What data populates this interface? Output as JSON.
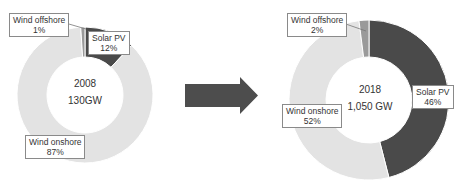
{
  "chart_data": [
    {
      "type": "pie",
      "subtype": "donut",
      "title": "2008",
      "total": "130GW",
      "categories": [
        "Solar PV",
        "Wind onshore",
        "Wind offshore"
      ],
      "values": [
        12,
        87,
        1
      ],
      "unit": "%",
      "colors": [
        "#4a4a4a",
        "#e3e3e3",
        "#9a9a9a"
      ]
    },
    {
      "type": "pie",
      "subtype": "donut",
      "title": "2018",
      "total": "1,050 GW",
      "categories": [
        "Solar PV",
        "Wind onshore",
        "Wind offshore"
      ],
      "values": [
        46,
        52,
        2
      ],
      "unit": "%",
      "colors": [
        "#4a4a4a",
        "#e3e3e3",
        "#9a9a9a"
      ]
    }
  ],
  "left": {
    "year": "2008",
    "total": "130GW",
    "labels": {
      "offshore": {
        "name": "Wind offshore",
        "pct": "1%"
      },
      "solar": {
        "name": "Solar PV",
        "pct": "12%"
      },
      "onshore": {
        "name": "Wind onshore",
        "pct": "87%"
      }
    }
  },
  "right": {
    "year": "2018",
    "total": "1,050 GW",
    "labels": {
      "offshore": {
        "name": "Wind offshore",
        "pct": "2%"
      },
      "solar": {
        "name": "Solar PV",
        "pct": "46%"
      },
      "onshore": {
        "name": "Wind onshore",
        "pct": "52%"
      }
    }
  },
  "arrow": {
    "icon": "right-arrow-icon",
    "color": "#4d4d4d"
  }
}
